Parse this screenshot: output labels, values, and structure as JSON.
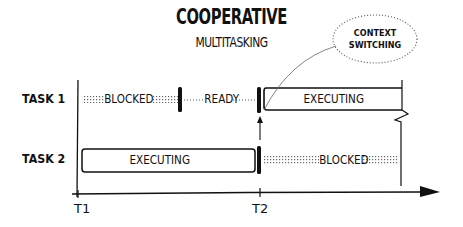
{
  "title": {
    "line1": "COOPERATIVE",
    "line2": "MULTITASKING"
  },
  "callout": {
    "line1": "CONTEXT",
    "line2": "SWITCHING"
  },
  "rows": [
    {
      "label": "TASK 1",
      "segments": [
        {
          "state": "BLOCKED",
          "style": "dotted-hatch",
          "from": "T1",
          "to": "mid"
        },
        {
          "state": "READY",
          "style": "dotted-line",
          "from": "mid",
          "to": "T2"
        },
        {
          "state": "EXECUTING",
          "style": "box",
          "from": "T2",
          "to": "end"
        }
      ]
    },
    {
      "label": "TASK 2",
      "segments": [
        {
          "state": "EXECUTING",
          "style": "box",
          "from": "T1",
          "to": "T2"
        },
        {
          "state": "BLOCKED",
          "style": "dotted-hatch",
          "from": "T2",
          "to": "end"
        }
      ]
    }
  ],
  "axis": {
    "ticks": [
      "T1",
      "T2"
    ]
  },
  "colors": {
    "ink": "#111111",
    "background": "#ffffff",
    "dots": "#555555"
  }
}
